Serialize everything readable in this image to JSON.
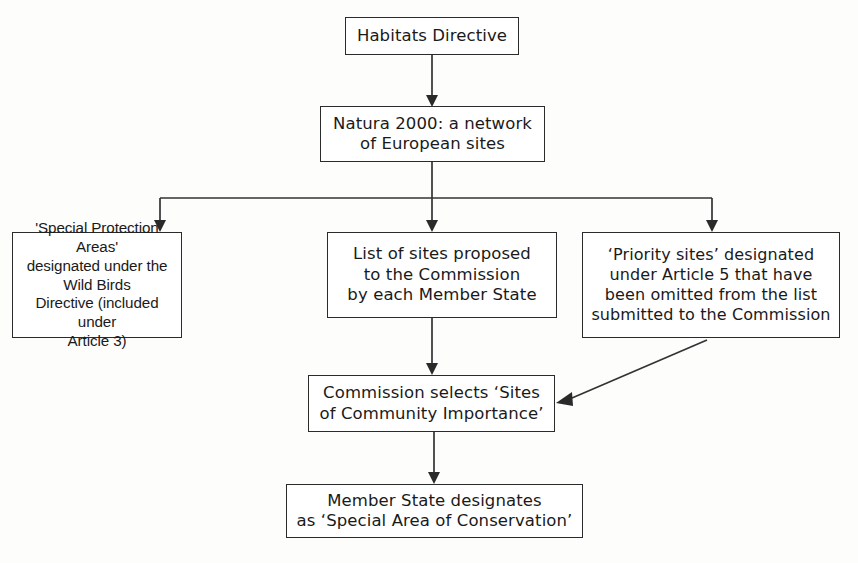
{
  "diagram": {
    "background_color": "#fdfdfc",
    "line_color": "#333333",
    "box_border_color": "#2b2b2b",
    "text_color": "#1a1a1a"
  },
  "nodes": {
    "habitats": {
      "label": "Habitats Directive"
    },
    "natura": {
      "label": "Natura 2000: a network\nof European sites"
    },
    "special_protection_areas": {
      "label": "'Special Protection Areas'\ndesignated under the Wild Birds\nDirective (included under\nArticle 3)"
    },
    "list_of_sites": {
      "label": "List of sites proposed\nto the Commission\nby each Member State"
    },
    "priority_sites": {
      "label": "‘Priority sites’ designated\nunder Article 5 that have\nbeen omitted from the list\nsubmitted to the Commission"
    },
    "commission_selects": {
      "label": "Commission selects ‘Sites\nof Community Importance’"
    },
    "member_state": {
      "label": "Member State designates\nas ‘Special Area of Conservation’"
    }
  },
  "edges": [
    {
      "id": "habitats-to-natura",
      "from": "habitats",
      "to": "natura",
      "style": "straight-down"
    },
    {
      "id": "natura-to-branch-bus",
      "from": "natura",
      "to": "branch-bus",
      "style": "straight-down"
    },
    {
      "id": "branch-to-special-protection",
      "from": "branch-bus",
      "to": "special_protection_areas",
      "style": "elbow-left"
    },
    {
      "id": "branch-to-list-of-sites",
      "from": "branch-bus",
      "to": "list_of_sites",
      "style": "straight-down"
    },
    {
      "id": "branch-to-priority-sites",
      "from": "branch-bus",
      "to": "priority_sites",
      "style": "elbow-right"
    },
    {
      "id": "list-to-commission",
      "from": "list_of_sites",
      "to": "commission_selects",
      "style": "straight-down"
    },
    {
      "id": "priority-to-commission",
      "from": "priority_sites",
      "to": "commission_selects",
      "style": "diagonal"
    },
    {
      "id": "commission-to-member-state",
      "from": "commission_selects",
      "to": "member_state",
      "style": "straight-down"
    }
  ]
}
